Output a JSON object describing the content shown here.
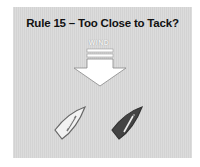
{
  "slide": {
    "title": "Rule 15 – Too Close to Tack?",
    "wind_label": "WIND",
    "icons": {
      "wind_arrow": "down-arrow-icon",
      "boat_left": "white-sailboat-icon",
      "boat_right": "dark-sailboat-icon"
    },
    "colors": {
      "background": "#d8d8d8",
      "arrow_fill": "#ffffff",
      "boat_left_fill": "#f2f2f2",
      "boat_right_fill": "#444444"
    }
  }
}
